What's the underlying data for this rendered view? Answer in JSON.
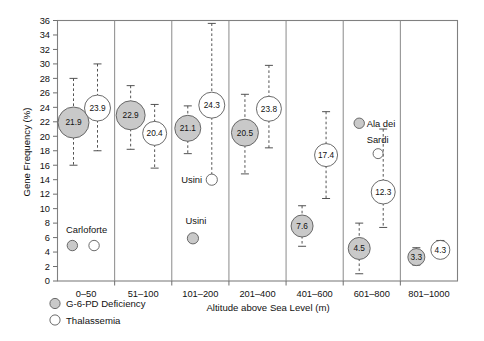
{
  "chart_data": {
    "type": "scatter",
    "title": "",
    "xlabel": "Altitude above Sea Level (m)",
    "ylabel": "Gene Frequency (%)",
    "ylim": [
      0,
      36
    ],
    "ytick_step": 2,
    "yticks": [
      "0",
      "2",
      "4",
      "6",
      "8",
      "10",
      "12",
      "14",
      "16",
      "18",
      "20",
      "22",
      "24",
      "26",
      "28",
      "30",
      "32",
      "34",
      "36"
    ],
    "categories": [
      "0–50",
      "51–100",
      "101–200",
      "201–400",
      "401–600",
      "601–800",
      "801–1000"
    ],
    "grid": false,
    "legend_position": "below-left",
    "series": [
      {
        "name": "G-6-PD Deficiency",
        "marker": "filled-circle",
        "color": "#c9c9c9",
        "values": [
          21.9,
          22.9,
          21.1,
          20.5,
          7.6,
          4.5,
          3.3
        ],
        "labels": [
          "21.9",
          "22.9",
          "21.1",
          "20.5",
          "7.6",
          "4.5",
          "3.3"
        ],
        "err_low": [
          16.0,
          18.2,
          17.6,
          14.8,
          4.8,
          1.0,
          2.2
        ],
        "err_high": [
          28.0,
          27.0,
          24.2,
          25.8,
          10.4,
          8.0,
          4.6
        ],
        "radius_px": [
          15.5,
          14.5,
          13.0,
          13.5,
          11.0,
          11.0,
          8.5
        ]
      },
      {
        "name": "Thalassemia",
        "marker": "open-circle",
        "color": "#ffffff",
        "values": [
          23.9,
          20.4,
          24.3,
          23.8,
          17.4,
          12.3,
          4.3
        ],
        "labels": [
          "23.9",
          "20.4",
          "24.3",
          "23.8",
          "17.4",
          "12.3",
          "4.3"
        ],
        "err_low": [
          18.0,
          15.6,
          13.8,
          18.4,
          11.4,
          7.4,
          3.2
        ],
        "err_high": [
          30.0,
          24.4,
          35.6,
          29.8,
          23.4,
          21.0,
          5.6
        ],
        "radius_px": [
          13.0,
          12.0,
          13.0,
          12.5,
          11.5,
          12.0,
          9.5
        ]
      }
    ],
    "annotations": [
      {
        "text": "Carloforte",
        "category": "0–50",
        "note": "locality marked by small filled and open circles near 5%"
      },
      {
        "text": "Usini",
        "category": "101–200",
        "note": "open circle near 14%"
      },
      {
        "text": "Usini",
        "category": "101–200",
        "note": "filled circle near 6%"
      },
      {
        "text": "Ala dei Sardi",
        "category": "601–800",
        "note": "filled and open circles near 21%"
      }
    ],
    "outlier_points": [
      {
        "label": "Carloforte",
        "series": "G-6-PD Deficiency",
        "value": 4.9
      },
      {
        "label": "Carloforte",
        "series": "Thalassemia",
        "value": 4.9
      },
      {
        "label": "Usini",
        "series": "Thalassemia",
        "value": 14.0
      },
      {
        "label": "Usini",
        "series": "G-6-PD Deficiency",
        "value": 5.9
      },
      {
        "label": "Ala dei Sardi",
        "series": "G-6-PD Deficiency",
        "value": 21.8
      },
      {
        "label": "Ala dei Sardi",
        "series": "Thalassemia",
        "value": 20.3
      }
    ]
  },
  "legend": {
    "items": [
      {
        "label": "G-6-PD Deficiency",
        "marker": "filled-circle"
      },
      {
        "label": "Thalassemia",
        "marker": "open-circle"
      }
    ]
  }
}
